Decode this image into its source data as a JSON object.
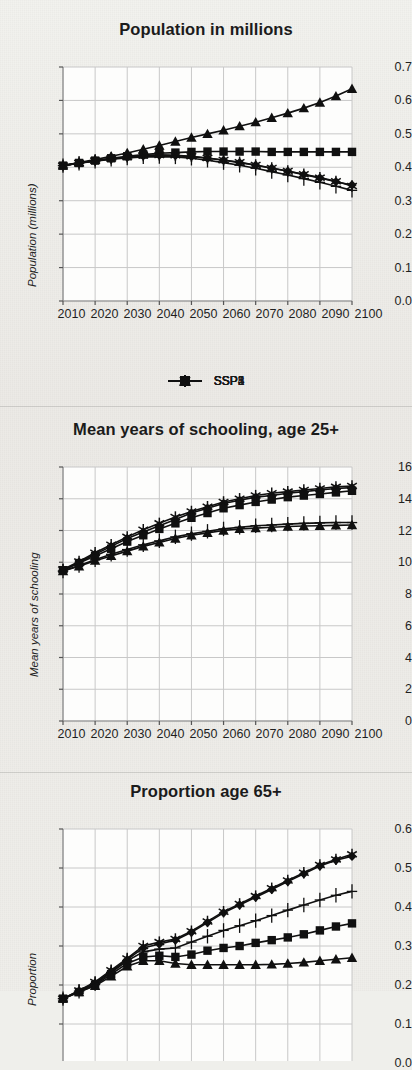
{
  "figure": {
    "background_color": "#efefeb",
    "ink_color": "#101010",
    "grid_color": "#c8c8c8"
  },
  "legend": {
    "position": "below-first-panel",
    "entries": [
      {
        "label": "SSP1",
        "marker": "diamond"
      },
      {
        "label": "SSP2",
        "marker": "square"
      },
      {
        "label": "SSP3",
        "marker": "triangle"
      },
      {
        "label": "SSP4",
        "marker": "plus"
      },
      {
        "label": "SSP5",
        "marker": "asterisk"
      }
    ]
  },
  "chart_data": [
    {
      "type": "line",
      "title": "Population in millions",
      "xlabel": "",
      "ylabel": "Population (millions)",
      "x": [
        2010,
        2015,
        2020,
        2025,
        2030,
        2035,
        2040,
        2045,
        2050,
        2055,
        2060,
        2065,
        2070,
        2075,
        2080,
        2085,
        2090,
        2095,
        2100
      ],
      "xticklabels": [
        "2010",
        "2020",
        "2030",
        "2040",
        "2050",
        "2060",
        "2070",
        "2080",
        "2090",
        "2100"
      ],
      "xlim": [
        2010,
        2100
      ],
      "ylim": [
        0.0,
        0.7
      ],
      "yticklabels": [
        "0.0",
        "0.1",
        "0.2",
        "0.3",
        "0.4",
        "0.5",
        "0.6",
        "0.7"
      ],
      "ytickvalues": [
        0.0,
        0.1,
        0.2,
        0.3,
        0.4,
        0.5,
        0.6,
        0.7
      ],
      "grid": true,
      "series": [
        {
          "name": "SSP1",
          "marker": "diamond",
          "values": [
            0.405,
            0.413,
            0.419,
            0.425,
            0.43,
            0.434,
            0.436,
            0.435,
            0.432,
            0.427,
            0.421,
            0.414,
            0.406,
            0.397,
            0.388,
            0.378,
            0.368,
            0.357,
            0.347
          ]
        },
        {
          "name": "SSP2",
          "marker": "square",
          "values": [
            0.405,
            0.413,
            0.42,
            0.427,
            0.433,
            0.438,
            0.442,
            0.444,
            0.446,
            0.447,
            0.447,
            0.447,
            0.447,
            0.446,
            0.446,
            0.446,
            0.446,
            0.446,
            0.446
          ]
        },
        {
          "name": "SSP3",
          "marker": "triangle",
          "values": [
            0.405,
            0.414,
            0.423,
            0.433,
            0.443,
            0.454,
            0.465,
            0.477,
            0.489,
            0.5,
            0.511,
            0.523,
            0.535,
            0.548,
            0.562,
            0.577,
            0.594,
            0.613,
            0.635
          ]
        },
        {
          "name": "SSP4",
          "marker": "plus",
          "values": [
            0.405,
            0.412,
            0.418,
            0.424,
            0.428,
            0.431,
            0.432,
            0.431,
            0.427,
            0.421,
            0.414,
            0.406,
            0.397,
            0.387,
            0.377,
            0.366,
            0.355,
            0.343,
            0.331
          ]
        },
        {
          "name": "SSP5",
          "marker": "asterisk",
          "values": [
            0.405,
            0.413,
            0.42,
            0.426,
            0.431,
            0.435,
            0.437,
            0.436,
            0.433,
            0.428,
            0.422,
            0.415,
            0.407,
            0.398,
            0.389,
            0.379,
            0.369,
            0.358,
            0.344
          ]
        }
      ]
    },
    {
      "type": "line",
      "title": "Mean years of schooling, age 25+",
      "xlabel": "",
      "ylabel": "Mean years of schooling",
      "x": [
        2010,
        2015,
        2020,
        2025,
        2030,
        2035,
        2040,
        2045,
        2050,
        2055,
        2060,
        2065,
        2070,
        2075,
        2080,
        2085,
        2090,
        2095,
        2100
      ],
      "xticklabels": [
        "2010",
        "2020",
        "2030",
        "2040",
        "2050",
        "2060",
        "2070",
        "2080",
        "2090",
        "2100"
      ],
      "xlim": [
        2010,
        2100
      ],
      "ylim": [
        0,
        16
      ],
      "yticklabels": [
        "0",
        "2",
        "4",
        "6",
        "8",
        "10",
        "12",
        "14",
        "16"
      ],
      "ytickvalues": [
        0,
        2,
        4,
        6,
        8,
        10,
        12,
        14,
        16
      ],
      "grid": true,
      "series": [
        {
          "name": "SSP1",
          "marker": "diamond",
          "values": [
            9.5,
            10.0,
            10.5,
            11.0,
            11.5,
            11.9,
            12.3,
            12.7,
            13.1,
            13.4,
            13.7,
            13.9,
            14.1,
            14.2,
            14.35,
            14.45,
            14.55,
            14.65,
            14.7
          ]
        },
        {
          "name": "SSP2",
          "marker": "square",
          "values": [
            9.5,
            9.95,
            10.4,
            10.85,
            11.3,
            11.7,
            12.1,
            12.45,
            12.8,
            13.1,
            13.4,
            13.6,
            13.8,
            13.95,
            14.1,
            14.2,
            14.3,
            14.4,
            14.5
          ]
        },
        {
          "name": "SSP3",
          "marker": "triangle",
          "values": [
            9.45,
            9.75,
            10.1,
            10.4,
            10.7,
            11.0,
            11.25,
            11.5,
            11.7,
            11.85,
            12.0,
            12.1,
            12.15,
            12.2,
            12.25,
            12.28,
            12.3,
            12.32,
            12.35
          ]
        },
        {
          "name": "SSP4",
          "marker": "plus",
          "values": [
            9.45,
            9.8,
            10.15,
            10.5,
            10.8,
            11.1,
            11.35,
            11.6,
            11.8,
            11.95,
            12.1,
            12.2,
            12.3,
            12.35,
            12.4,
            12.45,
            12.48,
            12.5,
            12.5
          ]
        },
        {
          "name": "SSP5",
          "marker": "asterisk",
          "values": [
            9.55,
            10.05,
            10.6,
            11.1,
            11.6,
            12.05,
            12.45,
            12.85,
            13.2,
            13.5,
            13.8,
            14.0,
            14.2,
            14.35,
            14.45,
            14.55,
            14.65,
            14.75,
            14.8
          ]
        }
      ]
    },
    {
      "type": "line",
      "title": "Proportion age 65+",
      "xlabel": "",
      "ylabel": "Proportion",
      "x": [
        2010,
        2015,
        2020,
        2025,
        2030,
        2035,
        2040,
        2045,
        2050,
        2055,
        2060,
        2065,
        2070,
        2075,
        2080,
        2085,
        2090,
        2095,
        2100
      ],
      "xticklabels": [
        "2010",
        "2020",
        "2030",
        "2040",
        "2050",
        "2060",
        "2070",
        "2080",
        "2090",
        "2100"
      ],
      "xlim": [
        2010,
        2100
      ],
      "ylim": [
        0.0,
        0.6
      ],
      "yticklabels": [
        "0.0",
        "0.1",
        "0.2",
        "0.3",
        "0.4",
        "0.5",
        "0.6"
      ],
      "ytickvalues": [
        0.0,
        0.1,
        0.2,
        0.3,
        0.4,
        0.5,
        0.6
      ],
      "grid": true,
      "truncated_at_bottom": true,
      "series": [
        {
          "name": "SSP1",
          "marker": "diamond",
          "values": [
            0.165,
            0.185,
            0.205,
            0.235,
            0.265,
            0.295,
            0.305,
            0.315,
            0.335,
            0.36,
            0.385,
            0.405,
            0.425,
            0.445,
            0.465,
            0.485,
            0.505,
            0.52,
            0.53
          ]
        },
        {
          "name": "SSP2",
          "marker": "square",
          "values": [
            0.165,
            0.182,
            0.2,
            0.228,
            0.255,
            0.272,
            0.275,
            0.272,
            0.278,
            0.288,
            0.295,
            0.3,
            0.308,
            0.315,
            0.322,
            0.33,
            0.34,
            0.35,
            0.358
          ]
        },
        {
          "name": "SSP3",
          "marker": "triangle",
          "values": [
            0.165,
            0.182,
            0.198,
            0.222,
            0.248,
            0.262,
            0.262,
            0.255,
            0.252,
            0.252,
            0.252,
            0.252,
            0.252,
            0.253,
            0.255,
            0.258,
            0.262,
            0.266,
            0.27
          ]
        },
        {
          "name": "SSP4",
          "marker": "plus",
          "values": [
            0.165,
            0.184,
            0.203,
            0.232,
            0.262,
            0.285,
            0.292,
            0.295,
            0.31,
            0.325,
            0.34,
            0.352,
            0.365,
            0.378,
            0.392,
            0.405,
            0.418,
            0.43,
            0.44
          ]
        },
        {
          "name": "SSP5",
          "marker": "asterisk",
          "values": [
            0.165,
            0.186,
            0.208,
            0.238,
            0.268,
            0.3,
            0.31,
            0.318,
            0.338,
            0.363,
            0.388,
            0.408,
            0.428,
            0.448,
            0.468,
            0.488,
            0.508,
            0.522,
            0.535
          ]
        }
      ]
    }
  ]
}
